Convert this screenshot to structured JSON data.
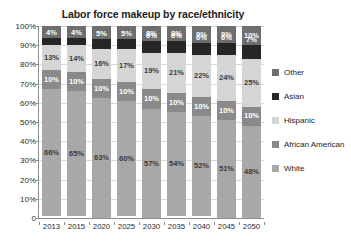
{
  "chart_data": {
    "type": "bar",
    "subtype": "stacked-percent-column",
    "title": "Labor force makeup by race/ethnicity",
    "xlabel": "",
    "ylabel": "",
    "categories": [
      "2013",
      "2015",
      "2020",
      "2025",
      "2030",
      "2035",
      "2040",
      "2045",
      "2050"
    ],
    "ylim": [
      0,
      100
    ],
    "ytick_labels": [
      "100%",
      "90%",
      "80%",
      "70%",
      "60%",
      "50%",
      "40%",
      "30%",
      "20%",
      "10%",
      "0"
    ],
    "ytick_values": [
      100,
      90,
      80,
      70,
      60,
      50,
      40,
      30,
      20,
      10,
      0
    ],
    "grid": true,
    "legend_position": "right",
    "stack_order_top_to_bottom": [
      "Other",
      "Asian",
      "Hispanic",
      "African American",
      "White"
    ],
    "series": [
      {
        "name": "Other",
        "color": "#6e6e6e",
        "label_style": "dark",
        "values": [
          6,
          6,
          7,
          7,
          8,
          8,
          9,
          9,
          10
        ],
        "labels": [
          "6%",
          "6%",
          "7%",
          "7%",
          "8%",
          "8%",
          "9%",
          "9%",
          "10%"
        ]
      },
      {
        "name": "Asian",
        "color": "#262626",
        "label_style": "dark",
        "values": [
          4,
          4,
          5,
          5,
          6,
          6,
          6,
          6,
          7
        ],
        "labels": [
          "4%",
          "4%",
          "5%",
          "5%",
          "6%",
          "6%",
          "6%",
          "6%",
          "7%"
        ]
      },
      {
        "name": "Hispanic",
        "color": "#d5d5d5",
        "label_style": "light",
        "values": [
          13,
          14,
          16,
          17,
          19,
          21,
          22,
          24,
          25
        ],
        "labels": [
          "13%",
          "14%",
          "16%",
          "17%",
          "19%",
          "21%",
          "22%",
          "24%",
          "25%"
        ]
      },
      {
        "name": "African American",
        "color": "#8a8a8a",
        "label_style": "dark",
        "values": [
          10,
          10,
          10,
          10,
          10,
          10,
          10,
          10,
          10
        ],
        "labels": [
          "10%",
          "10%",
          "10%",
          "10%",
          "10%",
          "10%",
          "10%",
          "10%",
          "10%"
        ]
      },
      {
        "name": "White",
        "color": "#a8a8a8",
        "label_style": "light",
        "values": [
          66,
          65,
          63,
          60,
          57,
          54,
          52,
          51,
          48
        ],
        "labels": [
          "66%",
          "65%",
          "63%",
          "60%",
          "57%",
          "54%",
          "52%",
          "51%",
          "48%"
        ]
      }
    ]
  },
  "legend": {
    "items": [
      {
        "label": "Other",
        "color": "#6e6e6e"
      },
      {
        "label": "Asian",
        "color": "#262626"
      },
      {
        "label": "Hispanic",
        "color": "#d5d5d5"
      },
      {
        "label": "African American",
        "color": "#8a8a8a"
      },
      {
        "label": "White",
        "color": "#a8a8a8"
      }
    ]
  },
  "colors": {
    "other": "#6e6e6e",
    "asian": "#262626",
    "hispanic": "#d5d5d5",
    "african_american": "#8a8a8a",
    "white": "#a8a8a8",
    "gridline": "#d8d8d8",
    "axis": "#8d8d8d",
    "text": "#1c1c1c",
    "background": "#ffffff"
  }
}
